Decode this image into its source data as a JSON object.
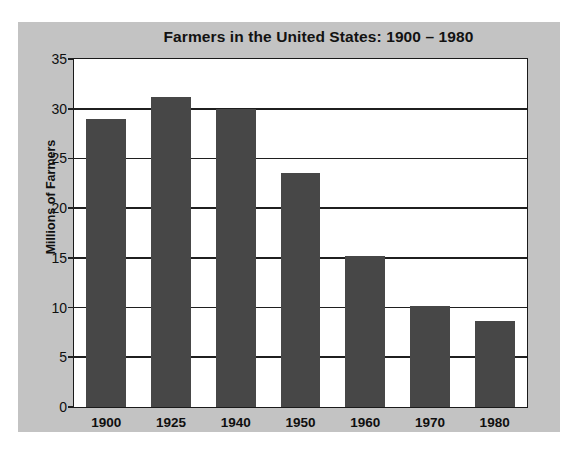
{
  "chart_data": {
    "type": "bar",
    "title": "Farmers in the United States: 1900 – 1980",
    "xlabel": "",
    "ylabel": "Millions of Farmers",
    "categories": [
      "1900",
      "1925",
      "1940",
      "1950",
      "1960",
      "1970",
      "1980"
    ],
    "values": [
      29.0,
      31.2,
      30.0,
      23.5,
      15.2,
      10.2,
      8.7
    ],
    "ylim": [
      0,
      35
    ],
    "ytick_labels": [
      "35",
      "30",
      "25",
      "20",
      "15",
      "10",
      "5",
      "0"
    ],
    "ytick_values": [
      35,
      30,
      25,
      20,
      15,
      10,
      5,
      0
    ],
    "grid": true,
    "legend": null,
    "bar_color": "#474747",
    "panel_color": "#c3c3c3",
    "plot_background": "#ffffff",
    "axis_color": "#1a1a1a"
  }
}
